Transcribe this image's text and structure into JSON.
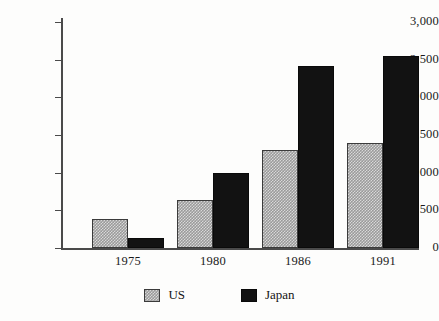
{
  "chart_data": {
    "type": "bar",
    "title": "",
    "subtitle": "",
    "xlabel": "",
    "ylabel": "",
    "categories": [
      "1975",
      "1980",
      "1986",
      "1991"
    ],
    "series": [
      {
        "name": "US",
        "values": [
          380,
          640,
          1300,
          1400
        ],
        "color": "#9a9a9a",
        "fill": "checkerboard-gray"
      },
      {
        "name": "Japan",
        "values": [
          130,
          1000,
          2420,
          2550
        ],
        "color": "#121212",
        "fill": "solid-black"
      }
    ],
    "ylim": [
      0,
      3000
    ],
    "yticks": [
      0,
      500,
      1000,
      1500,
      2000,
      2500,
      3000
    ],
    "ytick_labels": [
      "0",
      "500",
      "1,000",
      "1,500",
      "2,000",
      "2,500",
      "3,000"
    ],
    "grid": false,
    "legend": {
      "position": "bottom",
      "entries": [
        {
          "label": "US",
          "swatch": "checkerboard-gray-swatch"
        },
        {
          "label": "Japan",
          "swatch": "solid-black-swatch"
        }
      ]
    }
  }
}
